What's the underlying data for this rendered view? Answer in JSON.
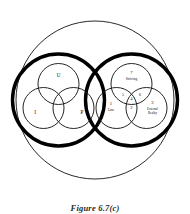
{
  "figure": {
    "caption": "Figure 6.7(c)",
    "left_cluster": {
      "name": "psyche-cluster",
      "labels": {
        "top": "U",
        "left": "I",
        "right": "P"
      }
    },
    "right_cluster": {
      "name": "numbered-cluster",
      "regions": {
        "top_number": "7",
        "top_word": "Striving",
        "left_number": "1",
        "left_word": "Law",
        "right_number": "3",
        "right_word_line1": "External",
        "right_word_line2": "Reality",
        "bottom_center_number": "2",
        "center_number": "4",
        "upper_left_overlap": "5",
        "upper_right_overlap": "6"
      }
    }
  },
  "colors": {
    "stroke": "#000000",
    "thin_stroke": "#1a1a1a",
    "background": "#ffffff",
    "caption": "#2a2a2a"
  }
}
